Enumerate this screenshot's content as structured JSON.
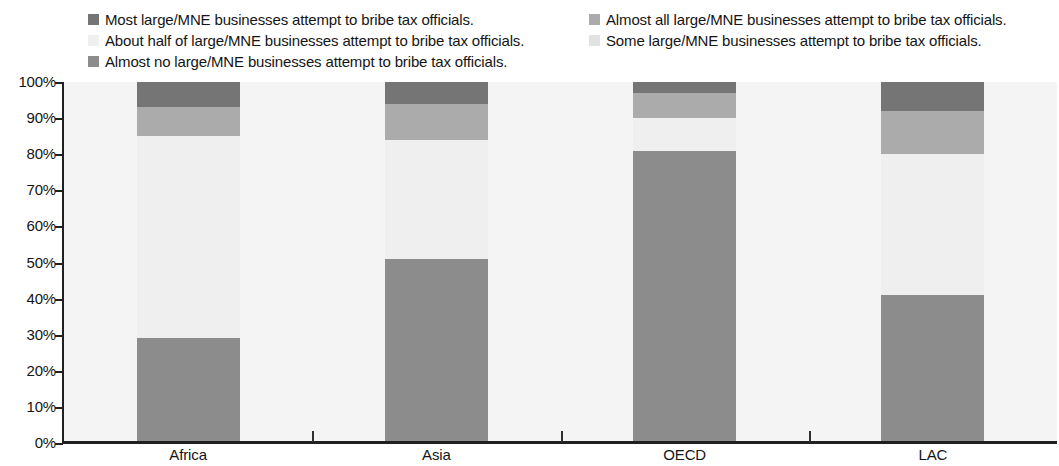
{
  "legend": {
    "columns": [
      {
        "items": [
          {
            "label": "Most large/MNE businesses attempt to bribe tax officials.",
            "color": "#757575",
            "key": "most"
          },
          {
            "label": "About half of large/MNE businesses attempt to bribe tax officials.",
            "color": "#efefef",
            "key": "about_half"
          },
          {
            "label": "Almost no large/MNE businesses attempt to bribe tax officials.",
            "color": "#8c8c8c",
            "key": "almost_no"
          }
        ]
      },
      {
        "items": [
          {
            "label": "Almost all large/MNE businesses attempt to bribe tax officials.",
            "color": "#ababab",
            "key": "almost_all"
          },
          {
            "label": "Some large/MNE businesses attempt to bribe tax officials.",
            "color": "#e2e2e2",
            "key": "some"
          }
        ]
      }
    ]
  },
  "chart_data": {
    "type": "bar",
    "subtype": "stacked-100-percent",
    "title": "",
    "xlabel": "",
    "ylabel": "",
    "ylim": [
      0,
      100
    ],
    "grid": false,
    "legend_position": "top",
    "categories": [
      "Africa",
      "Asia",
      "OECD",
      "LAC"
    ],
    "tick_labels": [
      "100%",
      "90%",
      "80%",
      "70%",
      "60%",
      "50%",
      "40%",
      "30%",
      "20%",
      "10%",
      "0%"
    ],
    "tick_values": [
      100,
      90,
      80,
      70,
      60,
      50,
      40,
      30,
      20,
      10,
      0
    ],
    "series": [
      {
        "name": "Almost no large/MNE businesses attempt to bribe tax officials.",
        "key": "almost_no",
        "color": "#8c8c8c",
        "values": [
          29,
          51,
          81,
          41
        ]
      },
      {
        "name": "Some large/MNE businesses attempt to bribe tax officials.",
        "key": "some",
        "color": "#e2e2e2",
        "values": [
          0,
          0,
          0,
          0
        ]
      },
      {
        "name": "About half of large/MNE businesses attempt to bribe tax officials.",
        "key": "about_half",
        "color": "#efefef",
        "values": [
          56,
          33,
          9,
          39
        ]
      },
      {
        "name": "Almost all large/MNE businesses attempt to bribe tax officials.",
        "key": "almost_all",
        "color": "#ababab",
        "values": [
          8,
          10,
          7,
          12
        ]
      },
      {
        "name": "Most large/MNE businesses attempt to bribe tax officials.",
        "key": "most",
        "color": "#757575",
        "values": [
          7,
          6,
          3,
          8
        ]
      }
    ],
    "plot_background": "#f4f4f4",
    "axis_color": "#202020"
  }
}
